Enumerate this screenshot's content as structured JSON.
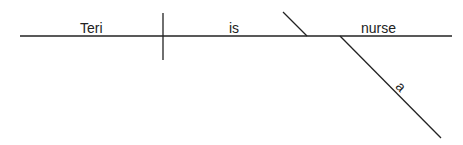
{
  "diagram": {
    "type": "sentence-diagram",
    "subject": "Teri",
    "verb": "is",
    "predicate_nominative": "nurse",
    "modifiers": [
      {
        "word": "a",
        "modifies": "nurse"
      }
    ]
  }
}
